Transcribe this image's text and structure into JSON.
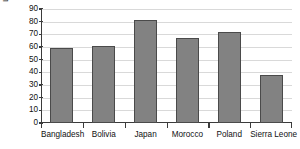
{
  "chart_data": {
    "type": "bar",
    "title": "",
    "xlabel": "",
    "ylabel": "Life expectancy (in years)",
    "categories": [
      "Bangladesh",
      "Bolivia",
      "Japan",
      "Morocco",
      "Poland",
      "Sierra Leone"
    ],
    "values": [
      59,
      61,
      81,
      67,
      72,
      38
    ],
    "ylim": [
      0,
      90
    ],
    "ytick_labels": [
      "0",
      "10",
      "20",
      "30",
      "40",
      "50",
      "60",
      "70",
      "80",
      "90"
    ],
    "ytick_values": [
      0,
      10,
      20,
      30,
      40,
      50,
      60,
      70,
      80,
      90
    ],
    "grid": true,
    "legend": "none",
    "bar_color": "#828282",
    "bar_edge_color": "#4a4a4a",
    "axis_color": "#3b3b3b",
    "grid_color": "#d9d9d9",
    "background_color": "#ffffff"
  }
}
